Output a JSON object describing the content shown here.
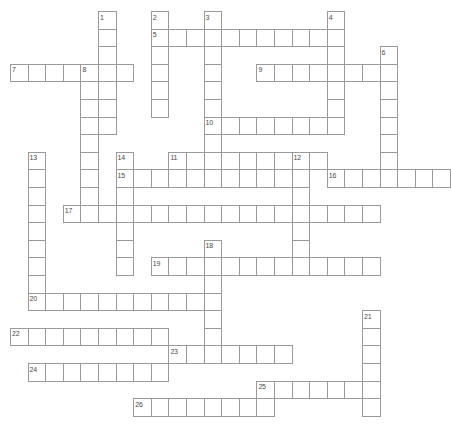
{
  "puzzle": {
    "title": "Crossword Puzzle Grid",
    "kind": "crossword-grid",
    "geometry": {
      "cell_size": 17.6,
      "origin_x": 10,
      "origin_y": 11,
      "cols": 25,
      "rows": 25,
      "border_color": "#9a9a9a",
      "cell_color": "#ffffff",
      "number_color": "#4a4a4a",
      "background": "#ffffff"
    },
    "entries": [
      {
        "number": "1",
        "direction": "down",
        "col": 5,
        "row": 0,
        "length": 7
      },
      {
        "number": "2",
        "direction": "down",
        "col": 8,
        "row": 0,
        "length": 6
      },
      {
        "number": "3",
        "direction": "down",
        "col": 11,
        "row": 0,
        "length": 9
      },
      {
        "number": "4",
        "direction": "down",
        "col": 18,
        "row": 0,
        "length": 7
      },
      {
        "number": "5",
        "direction": "across",
        "col": 8,
        "row": 1,
        "length": 11
      },
      {
        "number": "6",
        "direction": "down",
        "col": 21,
        "row": 2,
        "length": 7
      },
      {
        "number": "7",
        "direction": "across",
        "col": 0,
        "row": 3,
        "length": 7
      },
      {
        "number": "8",
        "direction": "down",
        "col": 4,
        "row": 3,
        "length": 9
      },
      {
        "number": "9",
        "direction": "across",
        "col": 14,
        "row": 3,
        "length": 8
      },
      {
        "number": "10",
        "direction": "across",
        "col": 11,
        "row": 6,
        "length": 7
      },
      {
        "number": "11",
        "direction": "across",
        "col": 9,
        "row": 8,
        "length": 9
      },
      {
        "number": "12",
        "direction": "down",
        "col": 16,
        "row": 8,
        "length": 7
      },
      {
        "number": "13",
        "direction": "down",
        "col": 1,
        "row": 8,
        "length": 9
      },
      {
        "number": "14",
        "direction": "down",
        "col": 6,
        "row": 8,
        "length": 7
      },
      {
        "number": "15",
        "direction": "across",
        "col": 6,
        "row": 9,
        "length": 11
      },
      {
        "number": "16",
        "direction": "across",
        "col": 18,
        "row": 9,
        "length": 7
      },
      {
        "number": "17",
        "direction": "across",
        "col": 3,
        "row": 11,
        "length": 18
      },
      {
        "number": "18",
        "direction": "down",
        "col": 11,
        "row": 13,
        "length": 7
      },
      {
        "number": "19",
        "direction": "across",
        "col": 8,
        "row": 14,
        "length": 13
      },
      {
        "number": "20",
        "direction": "across",
        "col": 1,
        "row": 16,
        "length": 10
      },
      {
        "number": "21",
        "direction": "down",
        "col": 20,
        "row": 17,
        "length": 6
      },
      {
        "number": "22",
        "direction": "across",
        "col": 0,
        "row": 18,
        "length": 9
      },
      {
        "number": "23",
        "direction": "across",
        "col": 9,
        "row": 19,
        "length": 7
      },
      {
        "number": "24",
        "direction": "across",
        "col": 1,
        "row": 20,
        "length": 8
      },
      {
        "number": "25",
        "direction": "across",
        "col": 14,
        "row": 21,
        "length": 7
      },
      {
        "number": "26",
        "direction": "across",
        "col": 7,
        "row": 22,
        "length": 8
      }
    ]
  }
}
